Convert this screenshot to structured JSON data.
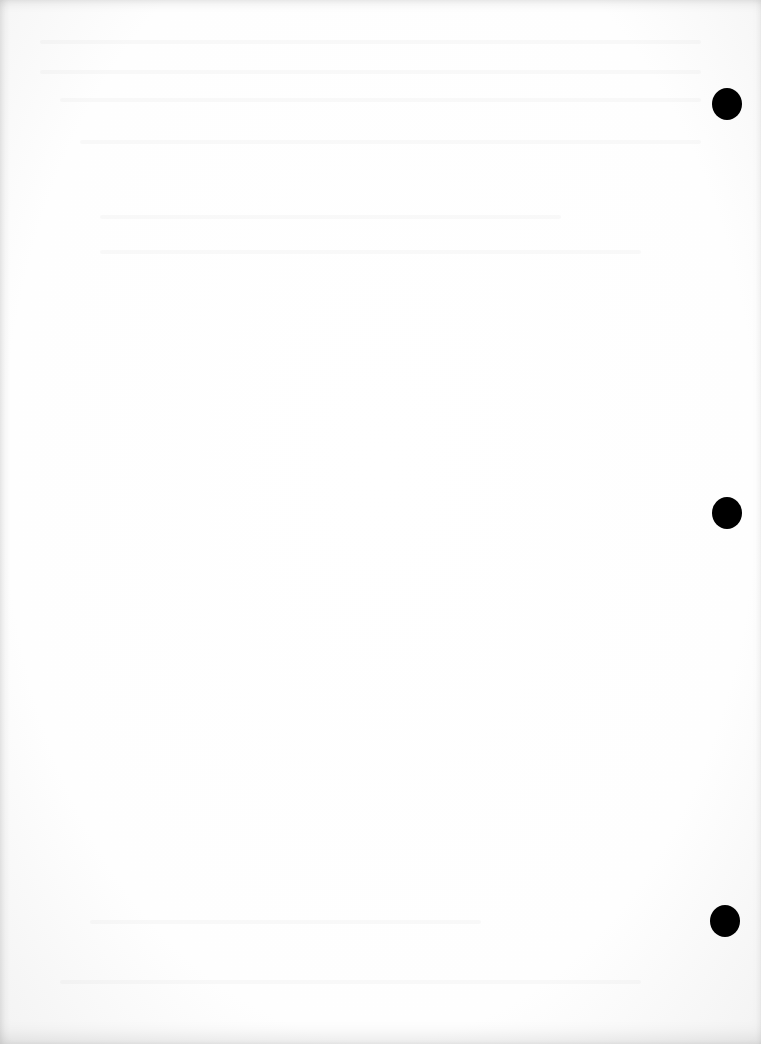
{
  "page": {
    "type": "blank-scanned-page",
    "background_color": "#ffffff",
    "edge_shade_color": "#f3f3f3",
    "text_content": "",
    "punch_holes": [
      {
        "cx": 727,
        "cy": 104,
        "rx": 15,
        "ry": 16
      },
      {
        "cx": 727,
        "cy": 513,
        "rx": 15,
        "ry": 16
      },
      {
        "cx": 725,
        "cy": 921,
        "rx": 15,
        "ry": 16
      }
    ],
    "hole_color": "#000000"
  }
}
